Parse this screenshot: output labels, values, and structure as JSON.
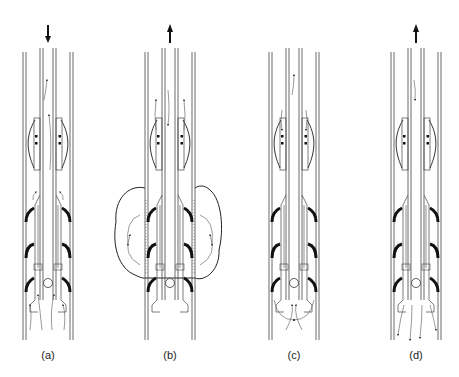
{
  "figure": {
    "panels": [
      {
        "id": "a",
        "label": "(a)",
        "center_x": 48,
        "flow_direction": "down",
        "has_cloud": false,
        "bottom_flow": "upward-streams"
      },
      {
        "id": "b",
        "label": "(b)",
        "center_x": 170,
        "flow_direction": "up",
        "has_cloud": true,
        "bottom_flow": "none"
      },
      {
        "id": "c",
        "label": "(c)",
        "center_x": 294,
        "flow_direction": "none",
        "has_cloud": false,
        "bottom_flow": "swirl-below-tool"
      },
      {
        "id": "d",
        "label": "(d)",
        "center_x": 416,
        "flow_direction": "up",
        "has_cloud": false,
        "bottom_flow": "downward-streams"
      }
    ],
    "colors": {
      "line": "#333333",
      "fill": "#111111",
      "background": "#ffffff"
    }
  }
}
